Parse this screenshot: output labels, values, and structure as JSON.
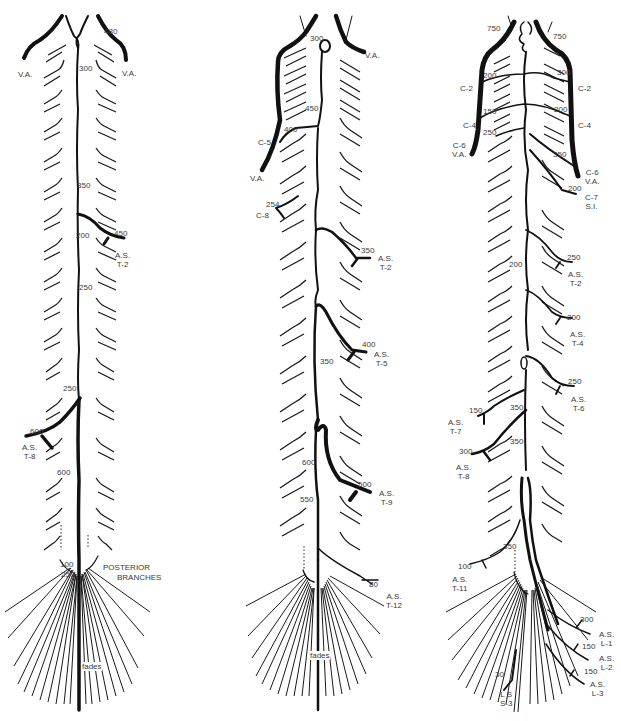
{
  "figure": {
    "panels": [
      {
        "id": "left",
        "labels": [
          {
            "text": "480",
            "x": 104,
            "y": 27
          },
          {
            "text": "V.A.",
            "x": 18,
            "y": 70
          },
          {
            "text": "V.A.",
            "x": 122,
            "y": 69
          },
          {
            "text": "300",
            "x": 79,
            "y": 64
          },
          {
            "text": "350",
            "x": 77,
            "y": 181
          },
          {
            "text": "450",
            "x": 114,
            "y": 229
          },
          {
            "text": "200",
            "x": 76,
            "y": 231
          },
          {
            "text": "A.S.\nT-2",
            "x": 115,
            "y": 251
          },
          {
            "text": "250",
            "x": 79,
            "y": 283
          },
          {
            "text": "250",
            "x": 63,
            "y": 384
          },
          {
            "text": "600",
            "x": 30,
            "y": 427
          },
          {
            "text": "A.S.\nT-8",
            "x": 22,
            "y": 443
          },
          {
            "text": "600",
            "x": 57,
            "y": 468
          },
          {
            "text": "100",
            "x": 60,
            "y": 560
          },
          {
            "text": "250",
            "x": 61,
            "y": 570
          },
          {
            "text": "POSTERIOR",
            "x": 103,
            "y": 563
          },
          {
            "text": "BRANCHES",
            "x": 117,
            "y": 573
          },
          {
            "text": "fades",
            "x": 82,
            "y": 662
          }
        ]
      },
      {
        "id": "middle",
        "labels": [
          {
            "text": "300",
            "x": 310,
            "y": 34
          },
          {
            "text": "V.A.",
            "x": 365,
            "y": 51
          },
          {
            "text": "450",
            "x": 305,
            "y": 104
          },
          {
            "text": "400",
            "x": 284,
            "y": 125
          },
          {
            "text": "C-5",
            "x": 258,
            "y": 138
          },
          {
            "text": "V.A.",
            "x": 250,
            "y": 174
          },
          {
            "text": "254",
            "x": 266,
            "y": 200
          },
          {
            "text": "C-8",
            "x": 256,
            "y": 211
          },
          {
            "text": "350",
            "x": 361,
            "y": 246
          },
          {
            "text": "A.S.\nT-2",
            "x": 378,
            "y": 254
          },
          {
            "text": "400",
            "x": 362,
            "y": 340
          },
          {
            "text": "A.S.\nT-5",
            "x": 374,
            "y": 350
          },
          {
            "text": "350",
            "x": 320,
            "y": 357
          },
          {
            "text": "600",
            "x": 302,
            "y": 458
          },
          {
            "text": "500",
            "x": 358,
            "y": 480
          },
          {
            "text": "A.S.\nT-9",
            "x": 379,
            "y": 489
          },
          {
            "text": "550",
            "x": 300,
            "y": 495
          },
          {
            "text": "80",
            "x": 369,
            "y": 580
          },
          {
            "text": "A.S.\nT-12",
            "x": 386,
            "y": 592
          },
          {
            "text": "fades",
            "x": 310,
            "y": 651
          }
        ]
      },
      {
        "id": "right",
        "labels": [
          {
            "text": "750",
            "x": 487,
            "y": 24
          },
          {
            "text": "750",
            "x": 553,
            "y": 32
          },
          {
            "text": "200",
            "x": 483,
            "y": 71
          },
          {
            "text": "300",
            "x": 557,
            "y": 68
          },
          {
            "text": "C-2",
            "x": 460,
            "y": 84
          },
          {
            "text": "C-2",
            "x": 578,
            "y": 84
          },
          {
            "text": "150",
            "x": 483,
            "y": 107
          },
          {
            "text": "200",
            "x": 554,
            "y": 105
          },
          {
            "text": "C-4",
            "x": 463,
            "y": 121
          },
          {
            "text": "C-4",
            "x": 578,
            "y": 121
          },
          {
            "text": "250",
            "x": 483,
            "y": 128
          },
          {
            "text": "C-6\nV.A.",
            "x": 452,
            "y": 141
          },
          {
            "text": "350",
            "x": 553,
            "y": 150
          },
          {
            "text": "C-6\nV.A.",
            "x": 585,
            "y": 168
          },
          {
            "text": "200",
            "x": 568,
            "y": 184
          },
          {
            "text": "C-7\nS.I.",
            "x": 585,
            "y": 193
          },
          {
            "text": "200",
            "x": 509,
            "y": 260
          },
          {
            "text": "250",
            "x": 567,
            "y": 253
          },
          {
            "text": "A.S.\nT-2",
            "x": 568,
            "y": 270
          },
          {
            "text": "200",
            "x": 567,
            "y": 313
          },
          {
            "text": "A.S.\nT-4",
            "x": 570,
            "y": 330
          },
          {
            "text": "250",
            "x": 568,
            "y": 377
          },
          {
            "text": "A.S.\nT-6",
            "x": 571,
            "y": 395
          },
          {
            "text": "150",
            "x": 469,
            "y": 406
          },
          {
            "text": "350",
            "x": 510,
            "y": 403
          },
          {
            "text": "A.S.\nT-7",
            "x": 448,
            "y": 418
          },
          {
            "text": "350",
            "x": 510,
            "y": 437
          },
          {
            "text": "300",
            "x": 459,
            "y": 447
          },
          {
            "text": "A.S.\nT-8",
            "x": 456,
            "y": 463
          },
          {
            "text": "350",
            "x": 503,
            "y": 542
          },
          {
            "text": "100",
            "x": 458,
            "y": 562
          },
          {
            "text": "A.S.\nT-11",
            "x": 452,
            "y": 575
          },
          {
            "text": "300",
            "x": 580,
            "y": 615
          },
          {
            "text": "A.S.\nL-1",
            "x": 599,
            "y": 630
          },
          {
            "text": "150",
            "x": 582,
            "y": 642
          },
          {
            "text": "A.S.\nL-2",
            "x": 599,
            "y": 654
          },
          {
            "text": "150",
            "x": 584,
            "y": 667
          },
          {
            "text": "A.S.\nL-3",
            "x": 590,
            "y": 680
          },
          {
            "text": "30",
            "x": 495,
            "y": 670
          },
          {
            "text": "L S\nS-3",
            "x": 500,
            "y": 690
          }
        ]
      }
    ]
  }
}
